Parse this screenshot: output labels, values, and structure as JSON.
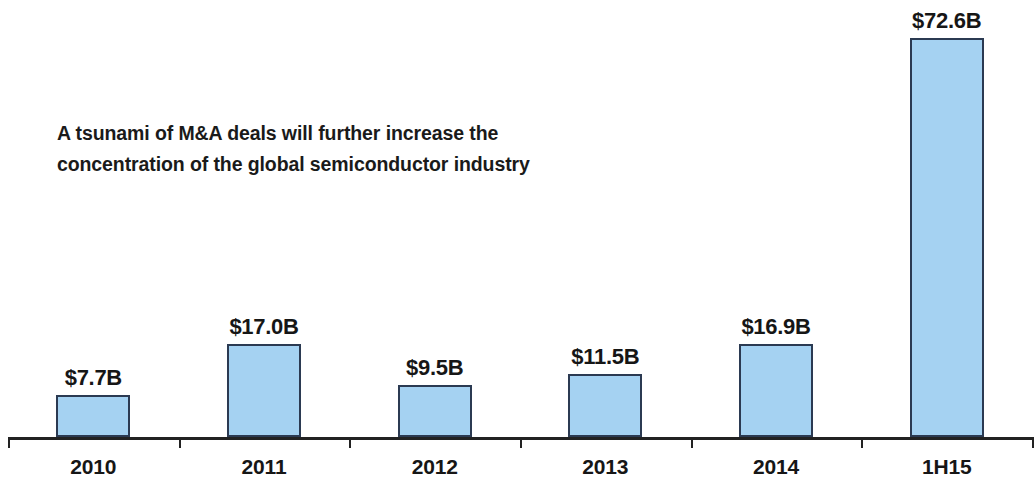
{
  "chart_data": {
    "type": "bar",
    "xlabel": "",
    "ylabel": "",
    "categories": [
      "2010",
      "2011",
      "2012",
      "2013",
      "2014",
      "1H15"
    ],
    "values": [
      7.7,
      17.0,
      9.5,
      11.5,
      16.9,
      72.6
    ],
    "data_labels": [
      "$7.7B",
      "$17.0B",
      "$9.5B",
      "$11.5B",
      "$16.9B",
      "$72.6B"
    ],
    "unit": "USD billions",
    "ylim": [
      0,
      77
    ],
    "grid": false,
    "legend": null,
    "series": [
      {
        "name": "Semiconductor M&A deal value",
        "values": [
          7.7,
          17.0,
          9.5,
          11.5,
          16.9,
          72.6
        ]
      }
    ],
    "colors": {
      "bar_fill": "#a5d2f2",
      "bar_border": "#2b3a52",
      "axis": "#222222",
      "text": "#161616",
      "background": "#ffffff"
    }
  },
  "annotation": {
    "line1": "A tsunami of M&A deals will further increase the",
    "line2": "concentration of the global semiconductor industry"
  }
}
